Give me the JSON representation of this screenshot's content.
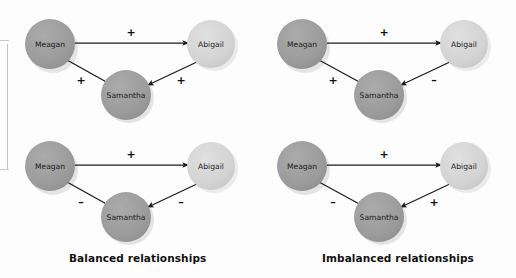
{
  "figure": {
    "title_left": "Balanced relationships",
    "title_right": "Imbalanced relationships",
    "people": {
      "meagan": "Meagan",
      "abigail": "Abigail",
      "samantha": "Samantha"
    },
    "colors": {
      "node_dark": "#9a9a9a",
      "node_light": "#d2d2d2",
      "node_mid": "#a8a8a8",
      "arrow": "#1a1a1a",
      "text": "#1b1b1b",
      "caption": "#111111",
      "background": "#fdfdfd"
    },
    "panels": [
      {
        "id": "balanced-all-positive",
        "position": "top-left",
        "group": "balanced",
        "edges": [
          {
            "from": "Meagan",
            "to": "Abigail",
            "sign": "+"
          },
          {
            "from": "Meagan",
            "to": "Samantha",
            "sign": "+"
          },
          {
            "from": "Abigail",
            "to": "Samantha",
            "sign": "+"
          }
        ]
      },
      {
        "id": "imbalanced-one-negative",
        "position": "top-right",
        "group": "imbalanced",
        "edges": [
          {
            "from": "Meagan",
            "to": "Abigail",
            "sign": "+"
          },
          {
            "from": "Meagan",
            "to": "Samantha",
            "sign": "+"
          },
          {
            "from": "Abigail",
            "to": "Samantha",
            "sign": "–"
          }
        ]
      },
      {
        "id": "balanced-two-negative",
        "position": "bottom-left",
        "group": "balanced",
        "edges": [
          {
            "from": "Meagan",
            "to": "Abigail",
            "sign": "+"
          },
          {
            "from": "Meagan",
            "to": "Samantha",
            "sign": "–"
          },
          {
            "from": "Abigail",
            "to": "Samantha",
            "sign": "–"
          }
        ]
      },
      {
        "id": "imbalanced-mixed",
        "position": "bottom-right",
        "group": "imbalanced",
        "edges": [
          {
            "from": "Meagan",
            "to": "Abigail",
            "sign": "+"
          },
          {
            "from": "Meagan",
            "to": "Samantha",
            "sign": "–"
          },
          {
            "from": "Abigail",
            "to": "Samantha",
            "sign": "+"
          }
        ]
      }
    ]
  }
}
